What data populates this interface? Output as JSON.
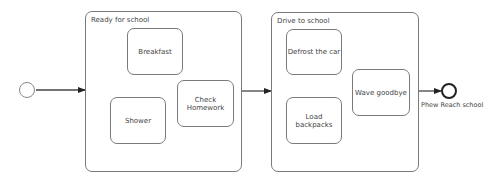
{
  "diagram": {
    "type": "state-machine",
    "initial_state": {
      "label": ""
    },
    "composites": [
      {
        "title": "Ready for school",
        "states": [
          {
            "label": "Breakfast"
          },
          {
            "label": "Shower"
          },
          {
            "label": "Check\nHomework"
          }
        ]
      },
      {
        "title": "Drive to school",
        "states": [
          {
            "label": "Defrost the car"
          },
          {
            "label": "Load\nbackpacks"
          },
          {
            "label": "Wave goodbye"
          }
        ]
      }
    ],
    "final_state": {
      "label": "Phew Reach school"
    },
    "transitions": [
      {
        "from": "initial",
        "to": "Ready for school"
      },
      {
        "from": "Ready for school",
        "to": "Drive to school"
      },
      {
        "from": "Drive to school",
        "to": "Phew Reach school"
      }
    ],
    "colors": {
      "border": "#7a7a7a",
      "edge": "#222222",
      "final_border": "#222222"
    }
  }
}
